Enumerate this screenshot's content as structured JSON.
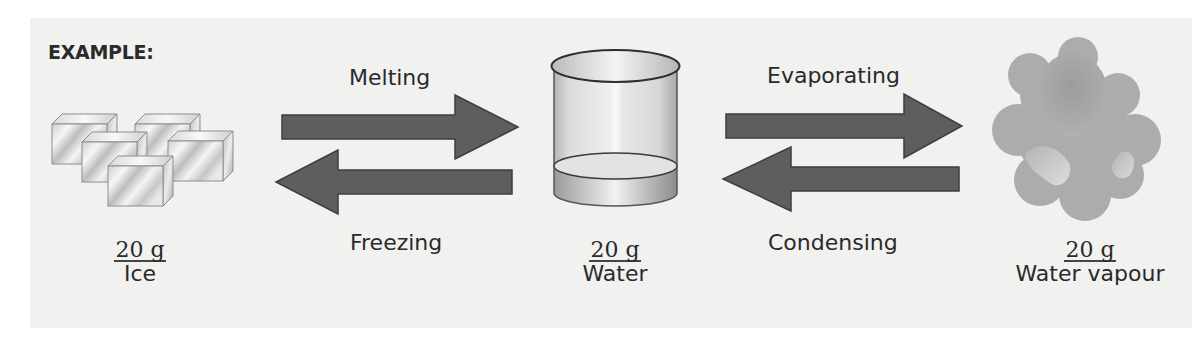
{
  "heading": "EXAMPLE:",
  "colors": {
    "panel_bg": "#f1f1f0",
    "arrow_fill": "#5e5e5e",
    "arrow_stroke": "#3e3e3e",
    "text": "#2a2a2a",
    "cloud": "#a8a8a8"
  },
  "states": [
    {
      "mass": "20 g",
      "name": "Ice",
      "icon": "ice-cubes-icon"
    },
    {
      "mass": "20 g",
      "name": "Water",
      "icon": "beaker-of-water-icon"
    },
    {
      "mass": "20 g",
      "name": "Water vapour",
      "icon": "vapour-cloud-icon"
    }
  ],
  "transitions": [
    {
      "label": "Melting",
      "direction": "right",
      "from": "Ice",
      "to": "Water"
    },
    {
      "label": "Freezing",
      "direction": "left",
      "from": "Water",
      "to": "Ice"
    },
    {
      "label": "Evaporating",
      "direction": "right",
      "from": "Water",
      "to": "Water vapour"
    },
    {
      "label": "Condensing",
      "direction": "left",
      "from": "Water vapour",
      "to": "Water"
    }
  ]
}
